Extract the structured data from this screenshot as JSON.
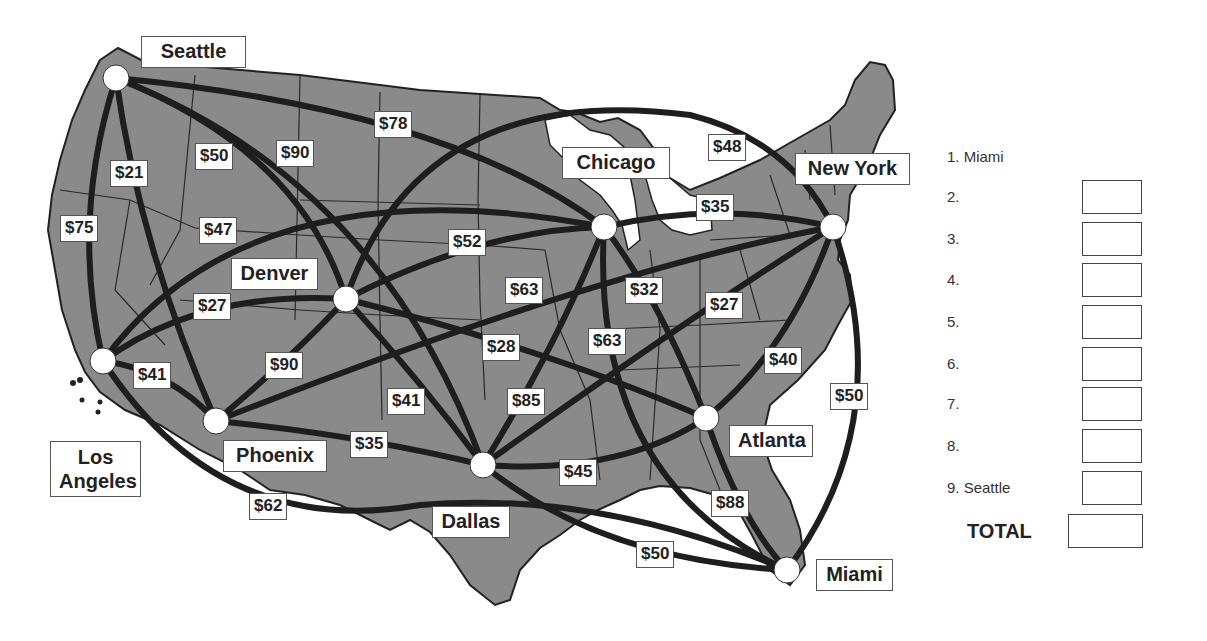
{
  "map": {
    "land_color": "#8a8a8a",
    "route_color": "#1e1e1e",
    "city_node_color": "#ffffff",
    "cities": [
      {
        "id": "seattle",
        "name": "Seattle",
        "x": 116,
        "y": 78,
        "label_x": 141,
        "label_y": 36,
        "label_w": 105
      },
      {
        "id": "los-angeles",
        "name": "Los Angeles",
        "x": 103,
        "y": 361,
        "label_x": 50,
        "label_y": 441,
        "label_w": 91,
        "two_line": true
      },
      {
        "id": "phoenix",
        "name": "Phoenix",
        "x": 216,
        "y": 421,
        "label_x": 223,
        "label_y": 440,
        "label_w": 104
      },
      {
        "id": "denver",
        "name": "Denver",
        "x": 346,
        "y": 299,
        "label_x": 231,
        "label_y": 258,
        "label_w": 87
      },
      {
        "id": "dallas",
        "name": "Dallas",
        "x": 483,
        "y": 465,
        "label_x": 432,
        "label_y": 506,
        "label_w": 78
      },
      {
        "id": "chicago",
        "name": "Chicago",
        "x": 604,
        "y": 227,
        "label_x": 562,
        "label_y": 147,
        "label_w": 108
      },
      {
        "id": "atlanta",
        "name": "Atlanta",
        "x": 706,
        "y": 418,
        "label_x": 729,
        "label_y": 425,
        "label_w": 84
      },
      {
        "id": "new-york",
        "name": "New York",
        "x": 833,
        "y": 227,
        "label_x": 795,
        "label_y": 153,
        "label_w": 115
      },
      {
        "id": "miami",
        "name": "Miami",
        "x": 787,
        "y": 570,
        "label_x": 816,
        "label_y": 559,
        "label_w": 77
      }
    ],
    "routes": [
      {
        "from": "seattle",
        "to": "los-angeles",
        "price": "$75",
        "label_x": 60,
        "label_y": 215
      },
      {
        "from": "seattle",
        "to": "phoenix",
        "price": "$21",
        "label_x": 110,
        "label_y": 160
      },
      {
        "from": "seattle",
        "to": "dallas",
        "price": "$50",
        "label_x": 195,
        "label_y": 143
      },
      {
        "from": "seattle",
        "to": "denver",
        "price": "$90",
        "label_x": 276,
        "label_y": 140
      },
      {
        "from": "seattle",
        "to": "chicago",
        "price": "$78",
        "label_x": 374,
        "label_y": 111
      },
      {
        "from": "los-angeles",
        "to": "chicago",
        "price": "$47",
        "label_x": 199,
        "label_y": 217
      },
      {
        "from": "los-angeles",
        "to": "denver",
        "price": "$27",
        "label_x": 193,
        "label_y": 293
      },
      {
        "from": "los-angeles",
        "to": "phoenix",
        "price": "$41",
        "label_x": 133,
        "label_y": 362
      },
      {
        "from": "los-angeles",
        "to": "miami",
        "price": "$62",
        "label_x": 249,
        "label_y": 493
      },
      {
        "from": "denver",
        "to": "chicago",
        "price": "$52",
        "label_x": 448,
        "label_y": 229
      },
      {
        "from": "phoenix",
        "to": "new-york",
        "price": "$63",
        "label_x": 505,
        "label_y": 277
      },
      {
        "from": "denver",
        "to": "atlanta",
        "price": "$28",
        "label_x": 482,
        "label_y": 334
      },
      {
        "from": "phoenix",
        "to": "denver",
        "price": "$90",
        "label_x": 265,
        "label_y": 352
      },
      {
        "from": "denver",
        "to": "dallas",
        "price": "$41",
        "label_x": 387,
        "label_y": 388
      },
      {
        "from": "dallas",
        "to": "chicago",
        "price": "$85",
        "label_x": 507,
        "label_y": 388
      },
      {
        "from": "phoenix",
        "to": "dallas",
        "price": "$35",
        "label_x": 350,
        "label_y": 431
      },
      {
        "from": "dallas",
        "to": "atlanta",
        "price": "$45",
        "label_x": 559,
        "label_y": 459
      },
      {
        "from": "dallas",
        "to": "miami",
        "price": "$50",
        "label_x": 636,
        "label_y": 541
      },
      {
        "from": "chicago",
        "to": "miami",
        "price": "$63",
        "label_x": 588,
        "label_y": 328
      },
      {
        "from": "chicago",
        "to": "atlanta",
        "price": "$32",
        "label_x": 625,
        "label_y": 277
      },
      {
        "from": "dallas",
        "to": "new-york",
        "price": "$27",
        "label_x": 705,
        "label_y": 292
      },
      {
        "from": "chicago",
        "to": "new-york",
        "price": "$35",
        "label_x": 696,
        "label_y": 194
      },
      {
        "from": "denver",
        "to": "new-york",
        "price": "$48",
        "label_x": 708,
        "label_y": 134
      },
      {
        "from": "atlanta",
        "to": "new-york",
        "price": "$40",
        "label_x": 764,
        "label_y": 347
      },
      {
        "from": "new-york",
        "to": "miami",
        "price": "$50",
        "label_x": 830,
        "label_y": 383
      },
      {
        "from": "atlanta",
        "to": "miami",
        "price": "$88",
        "label_x": 711,
        "label_y": 490
      }
    ]
  },
  "answer_sheet": {
    "rows": [
      {
        "label": "1. Miami",
        "has_box": false
      },
      {
        "label": "2.",
        "has_box": true
      },
      {
        "label": "3.",
        "has_box": true
      },
      {
        "label": "4.",
        "has_box": true
      },
      {
        "label": "5.",
        "has_box": true
      },
      {
        "label": "6.",
        "has_box": true
      },
      {
        "label": "7.",
        "has_box": true
      },
      {
        "label": "8.",
        "has_box": true
      },
      {
        "label": "9. Seattle",
        "has_box": true
      }
    ],
    "total_label": "TOTAL"
  }
}
